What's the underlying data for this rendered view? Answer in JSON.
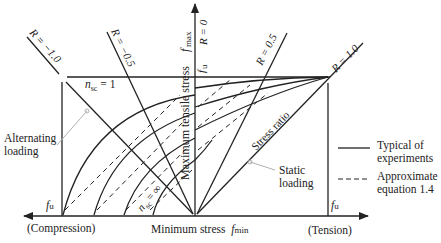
{
  "diagram": {
    "type": "Goodman-type fatigue stress diagram",
    "axes": {
      "vertical": {
        "label": "Maximum tensile stress",
        "symbol_main": "f",
        "symbol_sub": "max",
        "top_value_main": "f",
        "top_value_sub": "u"
      },
      "horizontal": {
        "label": "Minimum stress",
        "symbol_main": "f",
        "symbol_sub": "min",
        "left_end": "(Compression)",
        "right_end": "(Tension)",
        "left_value_main": "f",
        "left_value_sub": "u",
        "right_value_main": "f",
        "right_value_sub": "u"
      }
    },
    "stress_ratio_lines": [
      {
        "label": "R = −1.0"
      },
      {
        "label": "R = −0.5"
      },
      {
        "label": "R = 0"
      },
      {
        "label": "R = 0.5"
      },
      {
        "label": "R = 1.0"
      }
    ],
    "annotations": {
      "stress_ratio": "Stress ratio",
      "nsc_one_main": "n",
      "nsc_one_sub": "sc",
      "nsc_one_val": " = 1",
      "nsc_inf_main": "n",
      "nsc_inf_sub": "sc",
      "nsc_inf_val": " = ∞",
      "alternating_line1": "Alternating",
      "alternating_line2": "loading",
      "static_line1": "Static",
      "static_line2": "loading"
    },
    "legend": [
      {
        "style": "solid",
        "line1": "Typical of",
        "line2": "experiments"
      },
      {
        "style": "dashed",
        "line1": "Approximate",
        "line2": "equation 1.4"
      }
    ],
    "colors": {
      "ink": "#222222",
      "leader": "#b0b0b0",
      "background": "#ffffff"
    }
  }
}
